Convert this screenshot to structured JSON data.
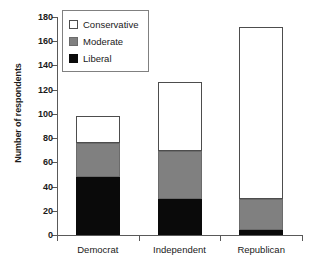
{
  "chart_data": {
    "type": "bar",
    "subtype": "stacked-bar",
    "title": "",
    "xlabel": "",
    "ylabel": "Number of respondents",
    "categories": [
      "Democrat",
      "Independent",
      "Republican"
    ],
    "series": [
      {
        "name": "Liberal",
        "color": "#0a0a0a",
        "values": [
          48,
          30,
          4
        ]
      },
      {
        "name": "Moderate",
        "color": "#808080",
        "values": [
          28,
          39,
          26
        ]
      },
      {
        "name": "Conservative",
        "color": "#ffffff",
        "values": [
          22,
          57,
          142
        ]
      }
    ],
    "stack_order": [
      "Liberal",
      "Moderate",
      "Conservative"
    ],
    "totals": [
      98,
      126,
      172
    ],
    "ylim": [
      0,
      180
    ],
    "ytick_step": 20,
    "yticks": [
      0,
      20,
      40,
      60,
      80,
      100,
      120,
      140,
      160,
      180
    ],
    "ytick_labels": [
      "0",
      "20",
      "40",
      "60",
      "80",
      "100",
      "120",
      "140",
      "160",
      "180"
    ],
    "grid": false,
    "legend_position": "top-left",
    "legend_entries": [
      "Conservative",
      "Moderate",
      "Liberal"
    ]
  },
  "legend": {
    "items": [
      {
        "label": "Conservative",
        "swatch": "white-square-swatch"
      },
      {
        "label": "Moderate",
        "swatch": "gray-square-swatch"
      },
      {
        "label": "Liberal",
        "swatch": "black-square-swatch"
      }
    ]
  },
  "axes": {
    "y_title": "Number of respondents"
  },
  "colors": {
    "liberal": "#0a0a0a",
    "moderate": "#808080",
    "conservative": "#ffffff",
    "axis": "#595959",
    "outline": "#4d4d4d"
  }
}
